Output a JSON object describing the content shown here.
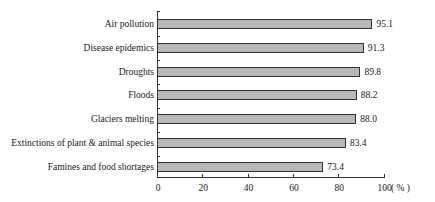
{
  "chart_data": {
    "type": "bar",
    "orientation": "horizontal",
    "title": "",
    "xlabel": "",
    "ylabel": "",
    "unit_label": "( % )",
    "categories": [
      "Air pollution",
      "Disease epidemics",
      "Droughts",
      "Floods",
      "Glaciers melting",
      "Extinctions of plant & animal species",
      "Famines and food shortages"
    ],
    "values": [
      95.1,
      91.3,
      89.8,
      88.2,
      88.0,
      83.4,
      73.4
    ],
    "value_labels": [
      "95.1",
      "91.3",
      "89.8",
      "88.2",
      "88.0",
      "83.4",
      "73.4"
    ],
    "xlim": [
      0,
      100
    ],
    "xticks": [
      "0",
      "20",
      "40",
      "60",
      "80",
      "100"
    ],
    "grid": false,
    "legend": null,
    "bar_color": "#b8b8b8"
  }
}
